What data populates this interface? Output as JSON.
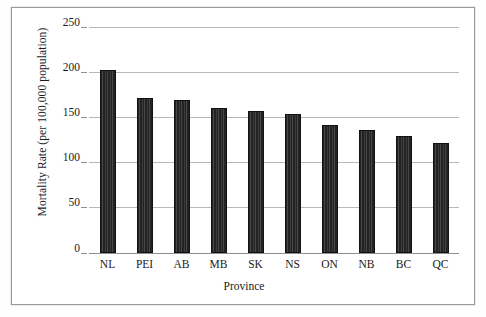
{
  "chart_data": {
    "type": "bar",
    "title": "",
    "subtitle": "",
    "xlabel": "Province",
    "ylabel": "Mortality Rate (per 100,000 population)",
    "categories": [
      "NL",
      "PEI",
      "AB",
      "MB",
      "SK",
      "NS",
      "ON",
      "NB",
      "BC",
      "QC"
    ],
    "values": [
      202,
      171,
      169,
      160,
      157,
      154,
      142,
      136,
      129,
      122
    ],
    "ylim": [
      0,
      250
    ],
    "ytick_values": [
      0,
      50,
      100,
      150,
      200,
      250
    ],
    "ytick_labels": [
      "0",
      "50",
      "100",
      "150",
      "200",
      "250"
    ],
    "grid": true,
    "grid_axis": "y",
    "legend": false,
    "legend_position": "none",
    "bar_color": "#232323",
    "gridline_color": "#b9b9b9",
    "frame_color": "#9a9a9a",
    "background_color": "#ffffff",
    "annotations": []
  }
}
